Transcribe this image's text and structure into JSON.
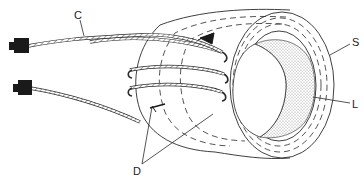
{
  "diagram": {
    "type": "technical-illustration",
    "labels": {
      "cable": "C",
      "outer_shell": "S",
      "inner_layer": "L",
      "windings": "D"
    },
    "components": [
      {
        "id": "plug-upper",
        "kind": "plug-terminal"
      },
      {
        "id": "plug-lower",
        "kind": "plug-terminal"
      },
      {
        "id": "cable",
        "kind": "braided-cable",
        "label": "C"
      },
      {
        "id": "toroid",
        "kind": "ring-core"
      },
      {
        "id": "outer-shell",
        "kind": "layer",
        "label": "S"
      },
      {
        "id": "inner-layer",
        "kind": "layer",
        "label": "L"
      },
      {
        "id": "core-fill",
        "kind": "stippled-core"
      },
      {
        "id": "winding-marks",
        "kind": "arrow-markers",
        "label": "D",
        "count": 2
      }
    ],
    "winding_turns": 3,
    "colors": {
      "line": "#2a2a2a",
      "plug": "#1a1a1a",
      "stipple": "#9a9a9a",
      "background": "#ffffff"
    }
  }
}
